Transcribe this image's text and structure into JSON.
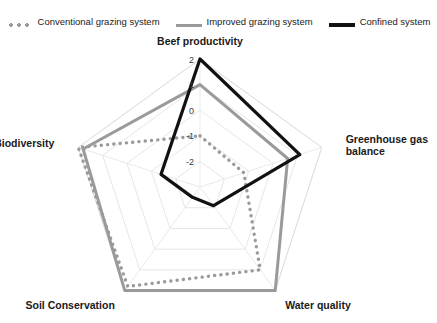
{
  "legend": {
    "position": "top",
    "items": [
      {
        "label": "Conventional grazing system",
        "style": "dotted",
        "color": "#9a9a9a",
        "icon": "dotted-line-swatch"
      },
      {
        "label": "Improved grazing system",
        "style": "solid",
        "color": "#9a9a9a",
        "icon": "solid-line-swatch"
      },
      {
        "label": "Confined system",
        "style": "solid",
        "color": "#111111",
        "icon": "solid-line-swatch"
      }
    ]
  },
  "chart_data": {
    "type": "radar",
    "title": "",
    "categories": [
      "Beef productivity",
      "Greenhouse gas balance",
      "Water quality",
      "Soil Conservation",
      "Biodiversity"
    ],
    "tick_labels": [
      "2",
      "1",
      "0",
      "-1",
      "-2"
    ],
    "tick_values": [
      2,
      1,
      0,
      -1,
      -2
    ],
    "rlim": [
      -3,
      2
    ],
    "grid": true,
    "series": [
      {
        "name": "Conventional grazing system",
        "style": "dotted",
        "color": "#9a9a9a",
        "values": [
          -1.0,
          -1.2,
          1.0,
          1.8,
          2.0
        ]
      },
      {
        "name": "Improved grazing system",
        "style": "solid",
        "color": "#9a9a9a",
        "values": [
          1.0,
          0.6,
          2.0,
          2.0,
          1.8
        ]
      },
      {
        "name": "Confined system",
        "style": "solid",
        "color": "#111111",
        "values": [
          2.0,
          1.1,
          -2.1,
          -2.5,
          -1.4
        ]
      }
    ],
    "xlabel": "",
    "ylabel": ""
  }
}
